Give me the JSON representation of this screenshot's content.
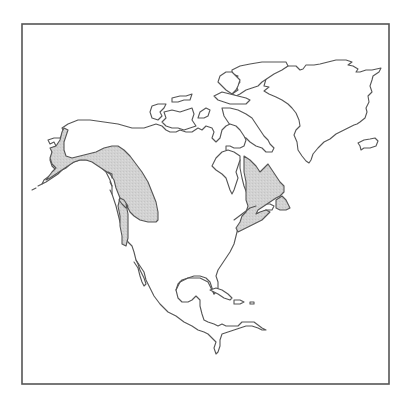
{
  "map": {
    "title": "",
    "region": "North America",
    "frame": {
      "x": 22,
      "y": 23,
      "width": 367,
      "height": 361
    },
    "colors": {
      "background": "#ffffff",
      "outline": "#555555",
      "range_fill": "#cfcfcf"
    },
    "legend": [],
    "shaded_ranges": [
      {
        "id": "western-range",
        "area": "Alaska, western Canada, Pacific Northwest coast"
      },
      {
        "id": "eastern-range",
        "area": "Quebec, Labrador, Maritimes, New England"
      }
    ]
  }
}
